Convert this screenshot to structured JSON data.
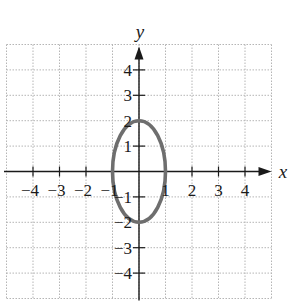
{
  "chart_data": {
    "type": "line",
    "title": "",
    "xlabel": "x",
    "ylabel": "y",
    "xlim": [
      -5,
      5
    ],
    "ylim": [
      -5,
      5
    ],
    "grid": true,
    "grid_style": "dotted",
    "x_ticks": [
      -4,
      -3,
      -2,
      -1,
      1,
      2,
      3,
      4
    ],
    "y_ticks": [
      -4,
      -3,
      -2,
      -1,
      1,
      2,
      3,
      4
    ],
    "x_tick_labels": [
      "−4",
      "−3",
      "−2",
      "−1",
      "1",
      "2",
      "3",
      "4"
    ],
    "y_tick_labels": [
      "−4",
      "−3",
      "−2",
      "−1",
      "1",
      "2",
      "3",
      "4"
    ],
    "series": [
      {
        "name": "ellipse",
        "shape": "ellipse",
        "equation": "x^2 + y^2/4 = 1",
        "center": [
          0,
          0
        ],
        "semi_axis_x": 1,
        "semi_axis_y": 2,
        "vertices": [
          [
            0,
            2
          ],
          [
            0,
            -2
          ],
          [
            1,
            0
          ],
          [
            -1,
            0
          ]
        ],
        "color": "#6e6e6e"
      }
    ]
  },
  "labels": {
    "x_axis": "x",
    "y_axis": "y"
  },
  "colors": {
    "curve": "#6e6e6e",
    "axis": "#1a1a1a",
    "grid": "#b5b5b5"
  }
}
